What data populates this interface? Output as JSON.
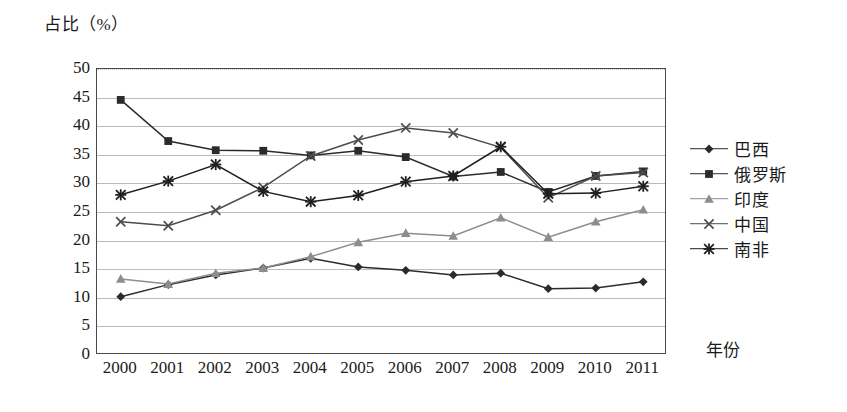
{
  "chart_data": {
    "type": "line",
    "title": "",
    "ylabel": "占比（%）",
    "xlabel": "年份",
    "ylim": [
      0,
      50
    ],
    "ytick_step": 5,
    "yticks": [
      "50",
      "45",
      "40",
      "35",
      "30",
      "25",
      "20",
      "15",
      "10",
      "5",
      "0"
    ],
    "grid": true,
    "legend_position": "right",
    "categories": [
      "2000",
      "2001",
      "2002",
      "2003",
      "2004",
      "2005",
      "2006",
      "2007",
      "2008",
      "2009",
      "2010",
      "2011"
    ],
    "series": [
      {
        "name": "巴西",
        "marker": "diamond",
        "color": "#2b2b2b",
        "values": [
          10.2,
          12.3,
          14.0,
          15.2,
          16.9,
          15.4,
          14.8,
          14.0,
          14.3,
          11.6,
          11.7,
          12.8
        ]
      },
      {
        "name": "俄罗斯",
        "marker": "square",
        "color": "#2b2b2b",
        "values": [
          44.6,
          37.4,
          35.8,
          35.7,
          34.9,
          35.7,
          34.6,
          31.2,
          32.0,
          28.5,
          31.3,
          32.1
        ]
      },
      {
        "name": "印度",
        "marker": "triangle",
        "color": "#8d8d8d",
        "values": [
          13.3,
          12.4,
          14.3,
          15.2,
          17.2,
          19.7,
          21.3,
          20.8,
          24.0,
          20.6,
          23.3,
          25.4
        ]
      },
      {
        "name": "中国",
        "marker": "cross",
        "color": "#4d4d4d",
        "values": [
          23.3,
          22.6,
          25.3,
          29.3,
          34.8,
          37.6,
          39.7,
          38.8,
          36.3,
          27.5,
          31.3,
          31.9
        ]
      },
      {
        "name": "南非",
        "marker": "asterisk",
        "color": "#1f1f1f",
        "values": [
          28.0,
          30.4,
          33.3,
          28.6,
          26.8,
          27.9,
          30.3,
          31.3,
          36.4,
          28.2,
          28.3,
          29.5
        ]
      }
    ]
  },
  "axes": {
    "y_title": "占比（%）",
    "x_title": "年份"
  }
}
